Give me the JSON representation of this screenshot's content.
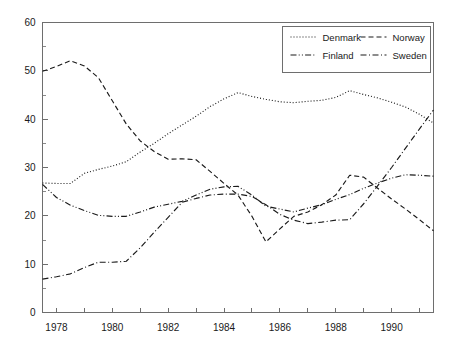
{
  "chart_data": {
    "type": "line",
    "title": "",
    "xlabel": "",
    "ylabel": "",
    "xlim": [
      1977.5,
      1991.5
    ],
    "ylim": [
      0,
      60
    ],
    "grid": false,
    "legend_position": "top-right",
    "xticks": [
      1978,
      1979,
      1980,
      1981,
      1982,
      1983,
      1984,
      1985,
      1986,
      1987,
      1988,
      1989,
      1990,
      1991
    ],
    "xtick_labels": [
      "1978",
      "",
      "1980",
      "",
      "1982",
      "",
      "1984",
      "",
      "1986",
      "",
      "1988",
      "",
      "1990",
      ""
    ],
    "yticks": [
      0,
      10,
      20,
      30,
      40,
      50,
      60
    ],
    "ytick_labels": [
      "0",
      "10",
      "20",
      "30",
      "40",
      "50",
      "60"
    ],
    "yticks_minor": [
      5,
      15,
      25,
      35,
      45,
      55
    ],
    "x": [
      1977.5,
      1978.0,
      1978.5,
      1979.0,
      1979.5,
      1980.0,
      1980.5,
      1981.0,
      1981.5,
      1982.0,
      1982.5,
      1983.0,
      1983.5,
      1984.0,
      1984.5,
      1985.0,
      1985.5,
      1986.0,
      1986.5,
      1987.0,
      1987.5,
      1988.0,
      1988.5,
      1989.0,
      1989.5,
      1990.0,
      1990.5,
      1991.0,
      1991.5
    ],
    "series": [
      {
        "name": "Denmark",
        "dash": "dotted",
        "values": [
          26.8,
          26.7,
          26.7,
          28.8,
          29.6,
          30.3,
          31.2,
          33.2,
          35.0,
          37.0,
          38.8,
          40.6,
          42.6,
          44.2,
          45.5,
          44.7,
          44.1,
          43.6,
          43.4,
          43.7,
          43.9,
          44.5,
          45.9,
          45.1,
          44.4,
          43.5,
          42.5,
          41.0,
          39.2
        ]
      },
      {
        "name": "Norway",
        "dash": "dashed",
        "values": [
          49.9,
          50.9,
          52.1,
          51.0,
          48.6,
          43.8,
          39.0,
          35.5,
          33.3,
          31.7,
          31.8,
          31.6,
          29.2,
          26.7,
          24.3,
          19.9,
          14.6,
          17.3,
          19.9,
          20.8,
          22.3,
          24.3,
          28.4,
          28.0,
          25.7,
          23.5,
          21.4,
          19.2,
          16.9
        ]
      },
      {
        "name": "Finland",
        "dash": "dashdotdot",
        "values": [
          26.5,
          23.8,
          22.2,
          21.1,
          20.1,
          19.9,
          19.9,
          20.8,
          21.8,
          22.4,
          23.0,
          24.3,
          25.5,
          26.0,
          26.1,
          24.3,
          22.0,
          21.4,
          20.8,
          21.6,
          22.3,
          23.4,
          24.4,
          25.7,
          26.8,
          27.8,
          28.5,
          28.4,
          28.2
        ]
      },
      {
        "name": "Sweden",
        "dash": "dashdot",
        "values": [
          6.9,
          7.4,
          8.0,
          9.3,
          10.4,
          10.4,
          10.6,
          13.4,
          16.6,
          19.7,
          22.8,
          23.6,
          24.3,
          24.5,
          24.5,
          24.0,
          22.3,
          20.3,
          19.1,
          18.4,
          18.7,
          19.1,
          19.2,
          22.5,
          26.2,
          30.0,
          34.0,
          38.0,
          41.9
        ]
      }
    ]
  },
  "legend": {
    "entries": [
      {
        "label": "Denmark"
      },
      {
        "label": "Norway"
      },
      {
        "label": "Finland"
      },
      {
        "label": "Sweden"
      }
    ]
  }
}
